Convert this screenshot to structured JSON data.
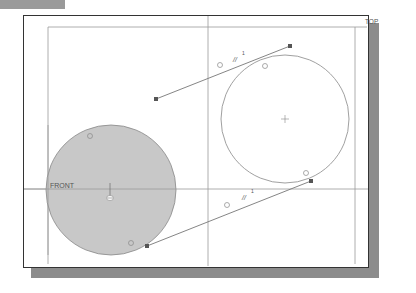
{
  "labels": {
    "top_plane": "TOP",
    "front_plane": "FRONT"
  },
  "constraints": {
    "parallel_symbol": "//",
    "parallel_index_upper": "1",
    "parallel_index_lower": "1"
  },
  "colors": {
    "frame": "#333333",
    "shadow": "#8c8c8c",
    "tab": "#9a9a9a",
    "geometry_line": "#777777",
    "filled_circle": "#c8c8c8",
    "endpoint": "#555555"
  },
  "geometry": {
    "left_circle": {
      "cx": 111,
      "cy": 190,
      "r": 65,
      "filled": true
    },
    "right_circle": {
      "cx": 285,
      "cy": 119,
      "r": 64,
      "filled": false
    },
    "upper_line": {
      "x1": 156,
      "y1": 99,
      "x2": 290,
      "y2": 46
    },
    "lower_line": {
      "x1": 147,
      "y1": 246,
      "x2": 311,
      "y2": 181
    }
  }
}
